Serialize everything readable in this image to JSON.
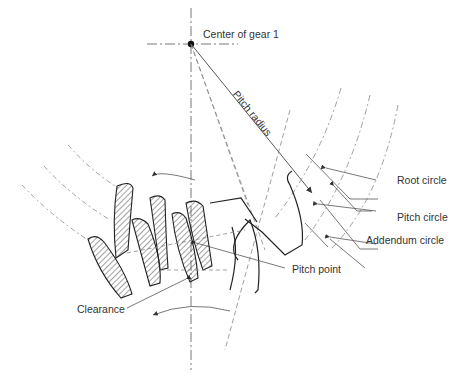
{
  "diagram": {
    "labels": {
      "center": "Center of gear 1",
      "pitch_radius": "Pitch radius",
      "root_circle": "Root circle",
      "pitch_circle": "Pitch circle",
      "addendum_circle": "Addendum circle",
      "pitch_point": "Pitch point",
      "clearance": "Clearance"
    },
    "colors": {
      "line": "#333333",
      "dashed": "#888888",
      "text": "#333333"
    }
  }
}
